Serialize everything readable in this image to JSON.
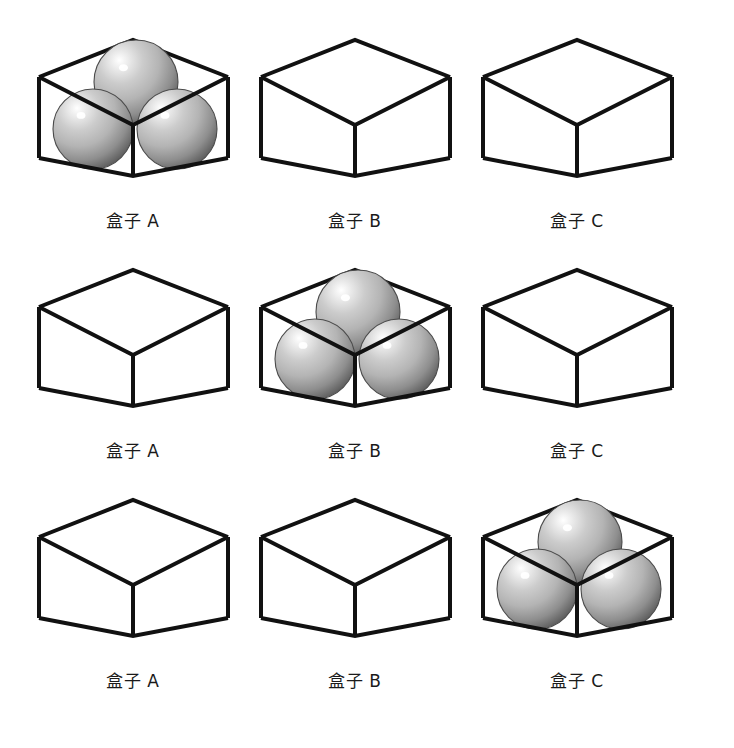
{
  "figure": {
    "type": "illustration-grid",
    "rows": 3,
    "columns": 3,
    "background_color": "#ffffff",
    "line_color": "#111111",
    "sphere_colors": {
      "highlight": "#ffffff",
      "mid": "#b4b4b4",
      "shadow": "#5a5a5a",
      "edge": "#4a4a4a"
    }
  },
  "rows": [
    {
      "index": 1,
      "cells": [
        {
          "label": "盒子 A",
          "box_id": "A",
          "sphere_count": 3,
          "filled": true
        },
        {
          "label": "盒子 B",
          "box_id": "B",
          "sphere_count": 0,
          "filled": false
        },
        {
          "label": "盒子 C",
          "box_id": "C",
          "sphere_count": 0,
          "filled": false
        }
      ]
    },
    {
      "index": 2,
      "cells": [
        {
          "label": "盒子 A",
          "box_id": "A",
          "sphere_count": 0,
          "filled": false
        },
        {
          "label": "盒子 B",
          "box_id": "B",
          "sphere_count": 3,
          "filled": true
        },
        {
          "label": "盒子 C",
          "box_id": "C",
          "sphere_count": 0,
          "filled": false
        }
      ]
    },
    {
      "index": 3,
      "cells": [
        {
          "label": "盒子 A",
          "box_id": "A",
          "sphere_count": 0,
          "filled": false
        },
        {
          "label": "盒子 B",
          "box_id": "B",
          "sphere_count": 0,
          "filled": false
        },
        {
          "label": "盒子 C",
          "box_id": "C",
          "sphere_count": 3,
          "filled": true
        }
      ]
    }
  ]
}
